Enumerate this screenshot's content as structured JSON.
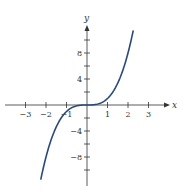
{
  "chart_data": {
    "type": "line",
    "title": "",
    "function": "y = x^3",
    "xlabel": "x",
    "ylabel": "y",
    "xlim": [
      -3.5,
      3.8
    ],
    "ylim": [
      -12,
      12
    ],
    "grid": false,
    "legend": null,
    "x_ticks": [
      -3,
      -2,
      -1,
      1,
      2,
      3
    ],
    "x_tick_labels": [
      "−3",
      "−2",
      "−1",
      "1",
      "2",
      "3"
    ],
    "y_ticks_minor": [
      -10,
      -8,
      -6,
      -4,
      -2,
      2,
      4,
      6,
      8,
      10
    ],
    "y_tick_labels": [
      {
        "value": 8,
        "label": "8"
      },
      {
        "value": 4,
        "label": "4"
      },
      {
        "value": -4,
        "label": "−4"
      },
      {
        "value": -8,
        "label": "−8"
      }
    ],
    "series": [
      {
        "name": "y = x^3",
        "color": "#2b4a7a",
        "x": [
          -2.25,
          -2.0,
          -1.75,
          -1.5,
          -1.25,
          -1.0,
          -0.75,
          -0.5,
          -0.25,
          0,
          0.25,
          0.5,
          0.75,
          1.0,
          1.25,
          1.5,
          1.75,
          2.0,
          2.25
        ],
        "y": [
          -11.39,
          -8.0,
          -5.36,
          -3.375,
          -1.95,
          -1.0,
          -0.42,
          -0.125,
          -0.016,
          0,
          0.016,
          0.125,
          0.42,
          1.0,
          1.95,
          3.375,
          5.36,
          8.0,
          11.39
        ]
      }
    ]
  },
  "layout": {
    "origin_px": [
      87,
      105
    ],
    "x_unit_px": 20.5,
    "y_unit_px": 6.5,
    "x_axis_px": [
      5,
      166
    ],
    "y_axis_px": [
      30,
      186
    ],
    "axis_color": "#333333"
  }
}
